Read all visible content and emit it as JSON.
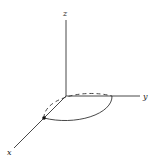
{
  "diagram": {
    "type": "3d-coordinate-axes",
    "axes": {
      "x_label": "x",
      "y_label": "y",
      "z_label": "z"
    },
    "circle": {
      "plane": "xy",
      "front_style": "solid",
      "back_style": "dashed"
    },
    "point": {
      "location": "intersection of circle and x-axis"
    },
    "colors": {
      "stroke": "#333333",
      "background": "#ffffff"
    }
  }
}
